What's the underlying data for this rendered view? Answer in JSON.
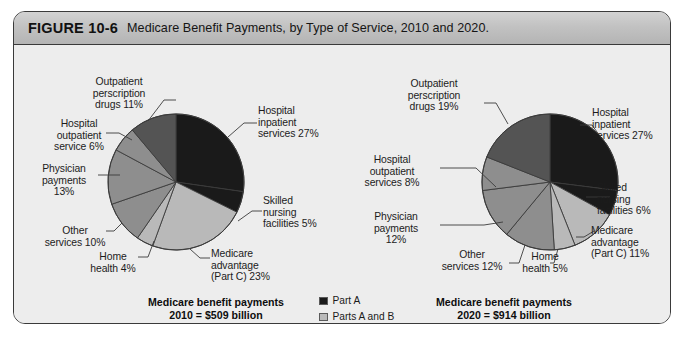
{
  "figure": {
    "number": "FIGURE 10-6",
    "title": "Medicare Benefit Payments, by Type of Service, 2010 and 2020."
  },
  "colors": {
    "part_a": "#1a1a1a",
    "parts_a_and_b": "#b9b9b9",
    "part_b": "#8e8e8e",
    "part_d": "#545454",
    "outline": "#3a3a3a",
    "panel_bg": "#eeeeee",
    "header_bg": "#c2c2c2"
  },
  "legend": {
    "items": [
      {
        "label": "Part A",
        "color": "#1a1a1a"
      },
      {
        "label": "Parts A and B",
        "color": "#b9b9b9"
      },
      {
        "label": "Part B",
        "color": "#8e8e8e"
      },
      {
        "label": "Part D",
        "color": "#545454"
      }
    ]
  },
  "captions": {
    "left_line1": "Medicare benefit payments",
    "left_line2": "2010 = $509 billion",
    "right_line1": "Medicare benefit payments",
    "right_line2": "2020 = $914 billion"
  },
  "labels_2010": {
    "outpatient_drugs": "Outpatient\nperscription\ndrugs 11%",
    "hospital_outpatient": "Hospital\noutpatient\nservice 6%",
    "physician": "Physician\npayments\n13%",
    "other_services": "Other\nservices 10%",
    "home_health": "Home\nhealth 4%",
    "medicare_advantage": "Medicare\nadvantage\n(Part C) 23%",
    "skilled_nursing": "Skilled\nnursing\nfacilities 5%",
    "hospital_inpatient": "Hospital\ninpatient\nservices 27%"
  },
  "labels_2020": {
    "outpatient_drugs": "Outpatient\nperscription\ndrugs 19%",
    "hospital_outpatient": "Hospital\noutpatient\nservices 8%",
    "physician": "Physician\npayments\n12%",
    "other_services": "Other\nservices 12%",
    "home_health": "Home\nhealth 5%",
    "medicare_advantage": "Medicare\nadvantage\n(Part C) 11%",
    "skilled_nursing": "Skilled\nnursing\nfacilities 6%",
    "hospital_inpatient": "Hospital\ninpatient\nservices 27%"
  },
  "chart_data": [
    {
      "type": "pie",
      "title": "Medicare benefit payments 2010 = $509 billion",
      "total": "$509 billion",
      "year": "2010",
      "legend_position": "center",
      "slices": [
        {
          "label": "Hospital inpatient services",
          "value": 27,
          "part": "Part A",
          "color": "#1a1a1a"
        },
        {
          "label": "Skilled nursing facilities",
          "value": 5,
          "part": "Part A",
          "color": "#1a1a1a"
        },
        {
          "label": "Medicare advantage (Part C)",
          "value": 23,
          "part": "Parts A and B",
          "color": "#b9b9b9"
        },
        {
          "label": "Home health",
          "value": 4,
          "part": "Parts A and B",
          "color": "#b9b9b9"
        },
        {
          "label": "Other services",
          "value": 10,
          "part": "Part B",
          "color": "#8e8e8e"
        },
        {
          "label": "Physician payments",
          "value": 13,
          "part": "Part B",
          "color": "#8e8e8e"
        },
        {
          "label": "Hospital outpatient service",
          "value": 6,
          "part": "Part B",
          "color": "#8e8e8e"
        },
        {
          "label": "Outpatient perscription drugs",
          "value": 11,
          "part": "Part D",
          "color": "#545454"
        }
      ]
    },
    {
      "type": "pie",
      "title": "Medicare benefit payments 2020 = $914 billion",
      "total": "$914 billion",
      "year": "2020",
      "legend_position": "center",
      "slices": [
        {
          "label": "Hospital inpatient services",
          "value": 27,
          "part": "Part A",
          "color": "#1a1a1a"
        },
        {
          "label": "Skilled nursing facilities",
          "value": 6,
          "part": "Part A",
          "color": "#1a1a1a"
        },
        {
          "label": "Medicare advantage (Part C)",
          "value": 11,
          "part": "Parts A and B",
          "color": "#b9b9b9"
        },
        {
          "label": "Home health",
          "value": 5,
          "part": "Parts A and B",
          "color": "#b9b9b9"
        },
        {
          "label": "Other services",
          "value": 12,
          "part": "Part B",
          "color": "#8e8e8e"
        },
        {
          "label": "Physician payments",
          "value": 12,
          "part": "Part B",
          "color": "#8e8e8e"
        },
        {
          "label": "Hospital outpatient services",
          "value": 8,
          "part": "Part B",
          "color": "#8e8e8e"
        },
        {
          "label": "Outpatient perscription drugs",
          "value": 19,
          "part": "Part D",
          "color": "#545454"
        }
      ]
    }
  ]
}
